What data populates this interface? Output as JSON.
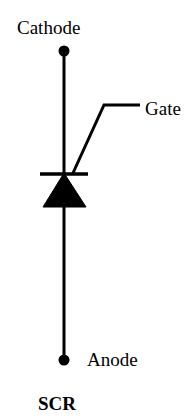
{
  "diagram": {
    "title": "SCR",
    "background_color": "#ffffff",
    "stroke_color": "#000000",
    "canvas": {
      "width": 194,
      "height": 420
    },
    "labels": {
      "cathode": "Cathode",
      "gate": "Gate",
      "anode": "Anode",
      "device": "SCR"
    },
    "symbol": {
      "name": "silicon-controlled-rectifier",
      "terminals": [
        {
          "name": "cathode",
          "label": "Cathode",
          "x": 64,
          "y": 51,
          "dot": true
        },
        {
          "name": "anode",
          "label": "Anode",
          "x": 64,
          "y": 360,
          "dot": true
        },
        {
          "name": "gate",
          "label": "Gate",
          "x": 140,
          "y": 105,
          "dot": false
        }
      ],
      "main_line": {
        "x": 64,
        "y1": 51,
        "y2": 360
      },
      "cathode_bar": {
        "x1": 40,
        "x2": 88,
        "y": 174
      },
      "triangle": {
        "direction": "up",
        "apex": {
          "x": 64,
          "y": 174
        },
        "base_left": {
          "x": 43,
          "y": 207
        },
        "base_right": {
          "x": 86,
          "y": 207
        },
        "fill": "#000000"
      },
      "gate_lead": {
        "start": {
          "x": 73,
          "y": 173
        },
        "kink": {
          "x": 104,
          "y": 105
        },
        "end": {
          "x": 140,
          "y": 105
        }
      },
      "stroke_width": 3
    }
  }
}
